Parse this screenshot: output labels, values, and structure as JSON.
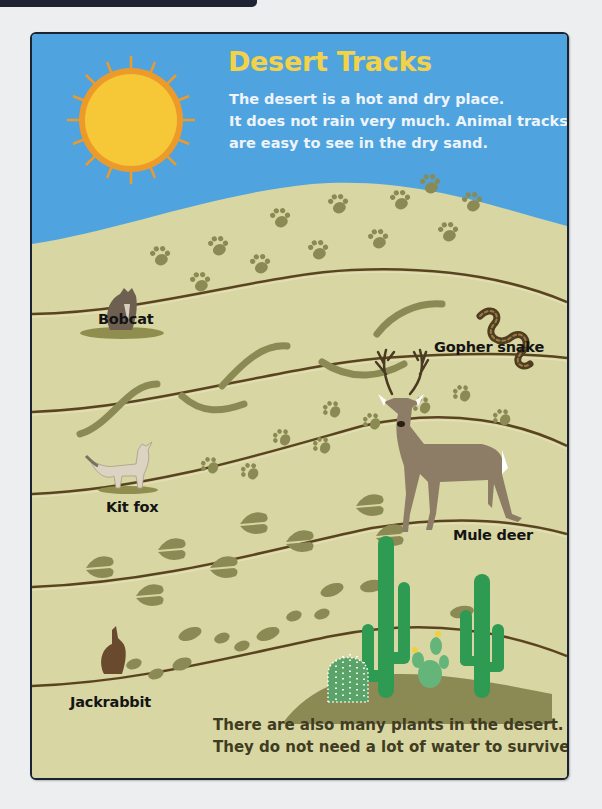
{
  "page": {
    "title": "Desert Tracks",
    "intro_lines": [
      "The desert is a hot and dry place.",
      "It does not rain very much. Animal tracks",
      "are easy to see in the dry sand."
    ],
    "outro_lines": [
      "There are also many plants in the desert.",
      "They do not need a lot of water to survive."
    ]
  },
  "animals": [
    {
      "name": "Bobcat",
      "track": "paw prints"
    },
    {
      "name": "Gopher snake",
      "track": "wavy slither marks"
    },
    {
      "name": "Kit fox",
      "track": "small paw prints"
    },
    {
      "name": "Mule deer",
      "track": "split hoof prints"
    },
    {
      "name": "Jackrabbit",
      "track": "oval hop prints"
    }
  ],
  "icons": {
    "sun": "sun-icon",
    "cactus": "cactus-icon"
  },
  "colors": {
    "sky": "#4fa4e0",
    "sand": "#d8d6a2",
    "track": "#8b8a55",
    "divider": "#5a4420",
    "title": "#f3d24a",
    "sun_core": "#f6c737",
    "sun_rays": "#ec9a2a",
    "cactus": "#2f9a52"
  }
}
